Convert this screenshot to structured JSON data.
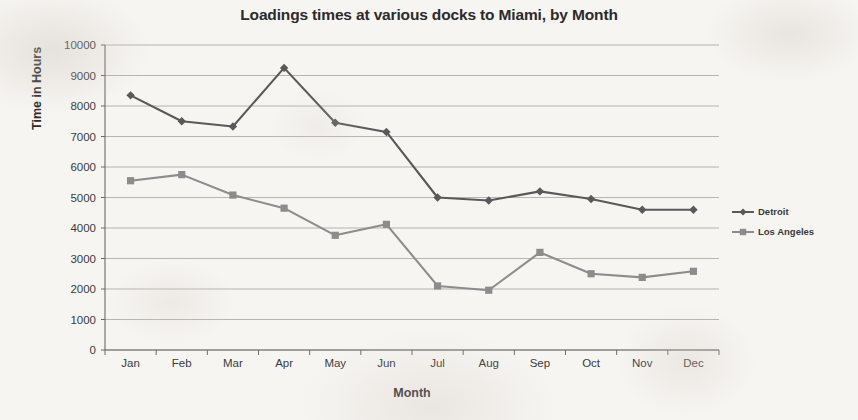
{
  "chart_data": {
    "type": "line",
    "title": "Loadings times at various docks to Miami, by Month",
    "xlabel": "Month",
    "ylabel": "Time in Hours",
    "categories": [
      "Jan",
      "Feb",
      "Mar",
      "Apr",
      "May",
      "Jun",
      "Jul",
      "Aug",
      "Sep",
      "Oct",
      "Nov",
      "Dec"
    ],
    "ylim": [
      0,
      10000
    ],
    "ytick_labels": [
      "10000",
      "9000",
      "8000",
      "7000",
      "6000",
      "5000",
      "4000",
      "3000",
      "2000",
      "1000",
      "0"
    ],
    "yticks": [
      10000,
      9000,
      8000,
      7000,
      6000,
      5000,
      4000,
      3000,
      2000,
      1000,
      0
    ],
    "grid": true,
    "legend_position": "right",
    "series": [
      {
        "name": "Detroit",
        "color": "#595959",
        "marker": "diamond",
        "values": [
          8350,
          7500,
          7330,
          9250,
          7450,
          7150,
          5000,
          4900,
          5200,
          4950,
          4600,
          4600
        ]
      },
      {
        "name": "Los Angeles",
        "color": "#8c8c8c",
        "marker": "square",
        "values": [
          5550,
          5750,
          5080,
          4650,
          3760,
          4120,
          2100,
          1960,
          3200,
          2500,
          2380,
          2580
        ]
      }
    ]
  },
  "legend": {
    "items": [
      {
        "label": "Detroit"
      },
      {
        "label": "Los Angeles"
      }
    ]
  }
}
